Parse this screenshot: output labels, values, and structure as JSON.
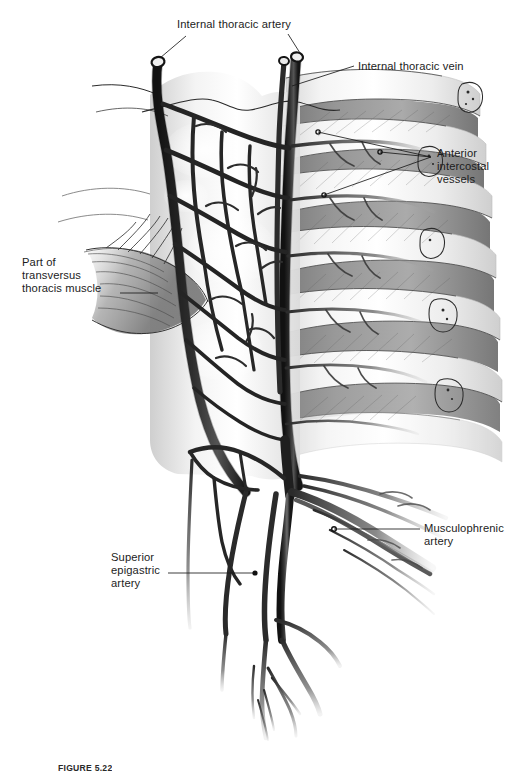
{
  "figure": {
    "kind": "anatomical-illustration",
    "background_color": "#ffffff",
    "ink_color": "#1b1b1b",
    "bone_light": "#fbfbfb",
    "muscle_gray": "#8e8e8e",
    "vessel_dark": "#2a2a2a",
    "labels": [
      {
        "id": "internal-thoracic-artery",
        "text": "Internal thoracic artery",
        "lines": [
          "Internal thoracic artery"
        ],
        "position": "top-center",
        "x": 177,
        "y": 18,
        "leader_count": 2
      },
      {
        "id": "internal-thoracic-vein",
        "text": "Internal thoracic vein",
        "lines": [
          "Internal thoracic vein"
        ],
        "position": "top-right",
        "x": 358,
        "y": 60,
        "leader_count": 1
      },
      {
        "id": "anterior-intercostal-vessels",
        "text": "Anterior intercostal vessels",
        "lines": [
          "Anterior",
          "intercostal",
          "vessels"
        ],
        "position": "right",
        "x": 437,
        "y": 147,
        "leader_count": 3
      },
      {
        "id": "part-of-transversus-thoracis-muscle",
        "text": "Part of transversus thoracis muscle",
        "lines": [
          "Part of",
          "transversus",
          "thoracis muscle"
        ],
        "position": "left",
        "x": 22,
        "y": 256,
        "leader_count": 1
      },
      {
        "id": "musculophrenic-artery",
        "text": "Musculophrenic artery",
        "lines": [
          "Musculophrenic",
          "artery"
        ],
        "position": "right",
        "x": 424,
        "y": 522,
        "leader_count": 1
      },
      {
        "id": "superior-epigastric-artery",
        "text": "Superior epigastric artery",
        "lines": [
          "Superior",
          "epigastric",
          "artery"
        ],
        "position": "left",
        "x": 111,
        "y": 551,
        "leader_count": 1
      }
    ],
    "caption": {
      "number": "FIGURE 5.22",
      "text": ""
    }
  }
}
